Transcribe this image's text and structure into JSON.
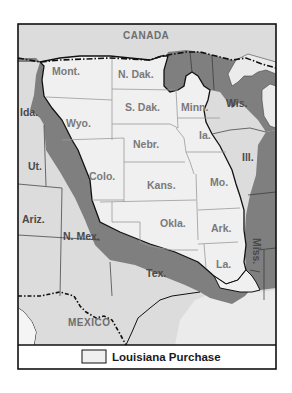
{
  "map": {
    "colors": {
      "purchase_fill": "#f0f0f0",
      "us_states_fill": "#7f7f7f",
      "foreign_fill": "#dcdcdc",
      "water_fill": "#e9e9e9",
      "border": "#111111",
      "state_line": "#9a9a9a"
    },
    "foreign_labels": {
      "canada": "CANADA",
      "mexico": "MEXICO"
    },
    "purchase_states": [
      {
        "id": "mont",
        "label": "Mont."
      },
      {
        "id": "ndak",
        "label": "N. Dak."
      },
      {
        "id": "sdak",
        "label": "S. Dak."
      },
      {
        "id": "minn",
        "label": "Minn."
      },
      {
        "id": "wyo",
        "label": "Wyo."
      },
      {
        "id": "nebr",
        "label": "Nebr."
      },
      {
        "id": "ia",
        "label": "Ia."
      },
      {
        "id": "colo",
        "label": "Colo."
      },
      {
        "id": "kans",
        "label": "Kans."
      },
      {
        "id": "mo",
        "label": "Mo."
      },
      {
        "id": "okla",
        "label": "Okla."
      },
      {
        "id": "ark",
        "label": "Ark."
      },
      {
        "id": "la",
        "label": "La."
      }
    ],
    "other_states": [
      {
        "id": "ida",
        "label": "Ida."
      },
      {
        "id": "ut",
        "label": "Ut."
      },
      {
        "id": "ariz",
        "label": "Ariz."
      },
      {
        "id": "nmex",
        "label": "N. Mex."
      },
      {
        "id": "tex",
        "label": "Tex."
      },
      {
        "id": "wis",
        "label": "Wis."
      },
      {
        "id": "ill",
        "label": "Ill."
      },
      {
        "id": "miss",
        "label": "Miss."
      }
    ],
    "legend": {
      "label": "Louisiana Purchase"
    }
  }
}
